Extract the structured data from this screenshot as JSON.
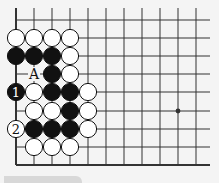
{
  "board": {
    "grid": {
      "x_lines": [
        16,
        34,
        52,
        70,
        88,
        106,
        124,
        142,
        160,
        178,
        196
      ],
      "y_lines": [
        20,
        38,
        56,
        74,
        92,
        111,
        129,
        147,
        165
      ],
      "top_extend": 8,
      "right_extend": 210,
      "left_edge": true,
      "bottom_edge": true
    },
    "colors": {
      "line": "#333333",
      "black_stone": "#111111",
      "white_stone": "#ffffff",
      "background": "#f4f4f4"
    },
    "stone_radius": 8.6,
    "stones": [
      {
        "col": 0,
        "row": 1,
        "color": "white"
      },
      {
        "col": 1,
        "row": 1,
        "color": "white"
      },
      {
        "col": 2,
        "row": 1,
        "color": "white"
      },
      {
        "col": 3,
        "row": 1,
        "color": "white"
      },
      {
        "col": 0,
        "row": 2,
        "color": "black"
      },
      {
        "col": 1,
        "row": 2,
        "color": "black"
      },
      {
        "col": 2,
        "row": 2,
        "color": "black"
      },
      {
        "col": 3,
        "row": 2,
        "color": "white"
      },
      {
        "col": 2,
        "row": 3,
        "color": "black"
      },
      {
        "col": 3,
        "row": 3,
        "color": "white"
      },
      {
        "col": 0,
        "row": 4,
        "color": "black",
        "label": "1"
      },
      {
        "col": 1,
        "row": 4,
        "color": "white"
      },
      {
        "col": 2,
        "row": 4,
        "color": "black"
      },
      {
        "col": 3,
        "row": 4,
        "color": "black"
      },
      {
        "col": 4,
        "row": 4,
        "color": "white"
      },
      {
        "col": 1,
        "row": 5,
        "color": "white"
      },
      {
        "col": 2,
        "row": 5,
        "color": "white"
      },
      {
        "col": 3,
        "row": 5,
        "color": "black"
      },
      {
        "col": 4,
        "row": 5,
        "color": "white"
      },
      {
        "col": 0,
        "row": 6,
        "color": "white",
        "label": "2"
      },
      {
        "col": 1,
        "row": 6,
        "color": "black"
      },
      {
        "col": 2,
        "row": 6,
        "color": "black"
      },
      {
        "col": 3,
        "row": 6,
        "color": "black"
      },
      {
        "col": 4,
        "row": 6,
        "color": "white"
      },
      {
        "col": 1,
        "row": 7,
        "color": "white"
      },
      {
        "col": 2,
        "row": 7,
        "color": "white"
      },
      {
        "col": 3,
        "row": 7,
        "color": "white"
      }
    ],
    "markers": [
      {
        "col": 1,
        "row": 3,
        "text": "A"
      }
    ],
    "star_points": [
      {
        "col": 9,
        "row": 5
      }
    ]
  }
}
